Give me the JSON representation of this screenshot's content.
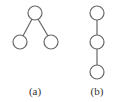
{
  "diagrams": [
    {
      "label": "(a)",
      "type": "tree",
      "nodes": [
        {
          "id": "root",
          "x": 35,
          "y": 13
        },
        {
          "id": "left",
          "x": 20,
          "y": 42
        },
        {
          "id": "right",
          "x": 51,
          "y": 42
        }
      ],
      "edges": [
        [
          "root",
          "left"
        ],
        [
          "root",
          "right"
        ]
      ]
    },
    {
      "label": "(b)",
      "type": "chain",
      "nodes": [
        {
          "id": "n1",
          "x": 97,
          "y": 13
        },
        {
          "id": "n2",
          "x": 97,
          "y": 42
        },
        {
          "id": "n3",
          "x": 97,
          "y": 72
        }
      ],
      "edges": [
        [
          "n1",
          "n2"
        ],
        [
          "n2",
          "n3"
        ]
      ]
    }
  ],
  "colors": {
    "stroke": "#666666",
    "text": "#333333"
  }
}
